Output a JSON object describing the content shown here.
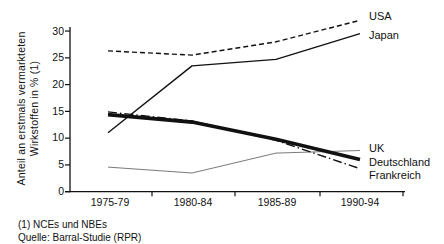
{
  "chart_data": {
    "type": "line",
    "ylabel_line1": "Anteil an erstmals vermarkteten",
    "ylabel_line2": "Wirkstoffen in % (1)",
    "categories": [
      "1975-79",
      "1980-84",
      "1985-89",
      "1990-94"
    ],
    "ylim": [
      0,
      30
    ],
    "yticks": [
      0,
      5,
      10,
      15,
      20,
      25,
      30
    ],
    "grid": false,
    "legend_position": "right, at line ends",
    "series": [
      {
        "name": "USA",
        "values": [
          26.3,
          25.5,
          28.0,
          32.0
        ],
        "line_style": "dashed",
        "line_weight": "thin",
        "color": "#111111"
      },
      {
        "name": "Japan",
        "values": [
          11.0,
          23.5,
          24.7,
          29.5
        ],
        "line_style": "solid",
        "line_weight": "thin",
        "color": "#111111"
      },
      {
        "name": "UK",
        "values": [
          4.6,
          3.5,
          7.2,
          7.7
        ],
        "line_style": "solid",
        "line_weight": "hairline",
        "color": "#7a7a7a"
      },
      {
        "name": "Deutschland",
        "values": [
          14.4,
          13.0,
          9.8,
          6.0
        ],
        "line_style": "solid",
        "line_weight": "thick",
        "color": "#111111"
      },
      {
        "name": "Frankreich",
        "values": [
          14.9,
          13.2,
          9.6,
          4.3
        ],
        "line_style": "dash-dot",
        "line_weight": "thin",
        "color": "#111111"
      }
    ],
    "footnotes": [
      "(1) NCEs und NBEs",
      "Quelle: Barral-Studie (RPR)"
    ]
  }
}
